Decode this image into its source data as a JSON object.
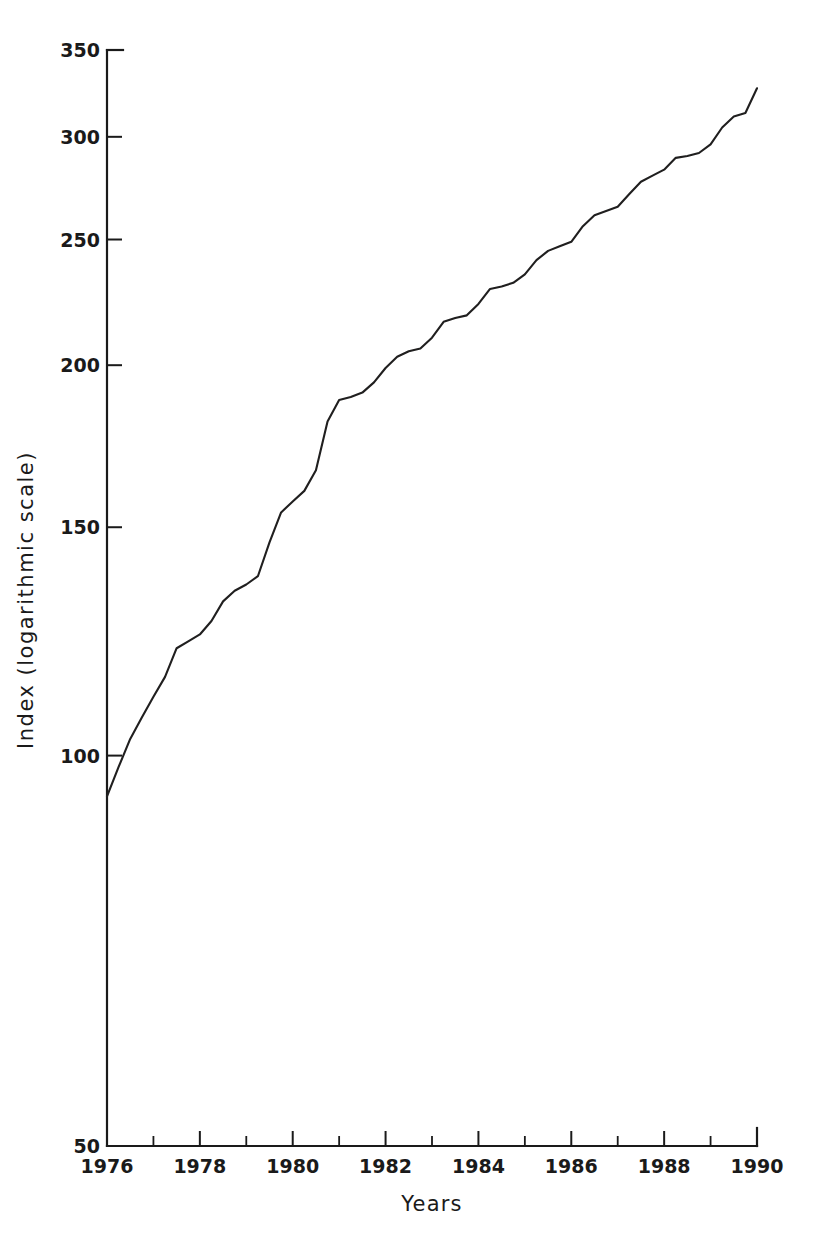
{
  "chart_data": {
    "type": "line",
    "title": "",
    "subtitle": "",
    "xlabel": "Years",
    "ylabel": "Index (logarithmic scale)",
    "yscale": "log",
    "xscale": "linear",
    "grid": false,
    "legend": null,
    "xlim": [
      1976,
      1990
    ],
    "ylim": [
      50,
      350
    ],
    "yticks": [
      50,
      100,
      150,
      200,
      250,
      300,
      350
    ],
    "ytick_labels": [
      "50",
      "100",
      "150",
      "200",
      "250",
      "300",
      "350"
    ],
    "xticks": [
      1976,
      1977,
      1978,
      1979,
      1980,
      1981,
      1982,
      1983,
      1984,
      1985,
      1986,
      1987,
      1988,
      1989,
      1990
    ],
    "xtick_labels": [
      "1976",
      "",
      "1978",
      "",
      "1980",
      "",
      "1982",
      "",
      "1984",
      "",
      "1986",
      "",
      "1988",
      "",
      "1990"
    ],
    "xtick_labels_shown": [
      "1976",
      "1978",
      "1980",
      "1982",
      "1984",
      "1986",
      "1988",
      "1990"
    ],
    "series": [
      {
        "name": "Index",
        "color": "#201f1f",
        "x": [
          1976.0,
          1976.25,
          1976.5,
          1976.75,
          1977.0,
          1977.25,
          1977.5,
          1977.75,
          1978.0,
          1978.25,
          1978.5,
          1978.75,
          1979.0,
          1979.25,
          1979.5,
          1979.75,
          1980.0,
          1980.25,
          1980.5,
          1980.75,
          1981.0,
          1981.25,
          1981.5,
          1981.75,
          1982.0,
          1982.25,
          1982.5,
          1982.75,
          1983.0,
          1983.25,
          1983.5,
          1983.75,
          1984.0,
          1984.25,
          1984.5,
          1984.75,
          1985.0,
          1985.25,
          1985.5,
          1985.75,
          1986.0,
          1986.25,
          1986.5,
          1986.75,
          1987.0,
          1987.25,
          1987.5,
          1987.75,
          1988.0,
          1988.25,
          1988.5,
          1988.75,
          1989.0,
          1989.25,
          1989.5,
          1989.75,
          1990.0
        ],
        "y": [
          93.0,
          98.0,
          103.0,
          107.0,
          111.0,
          115.0,
          121.0,
          122.5,
          124.0,
          127.0,
          131.5,
          134.0,
          135.5,
          137.5,
          146.0,
          154.0,
          157.0,
          160.0,
          166.0,
          181.0,
          188.0,
          189.0,
          190.5,
          194.0,
          199.0,
          203.0,
          205.0,
          206.0,
          210.0,
          216.0,
          217.5,
          218.5,
          223.0,
          229.0,
          230.0,
          231.5,
          235.0,
          241.0,
          245.0,
          247.0,
          249.0,
          256.0,
          261.0,
          263.0,
          265.0,
          271.0,
          277.0,
          280.0,
          283.0,
          289.0,
          290.0,
          291.5,
          296.0,
          305.0,
          311.0,
          313.0,
          327.0
        ]
      }
    ]
  },
  "axis": {
    "ylabel": "Index (logarithmic scale)",
    "xlabel": "Years"
  }
}
